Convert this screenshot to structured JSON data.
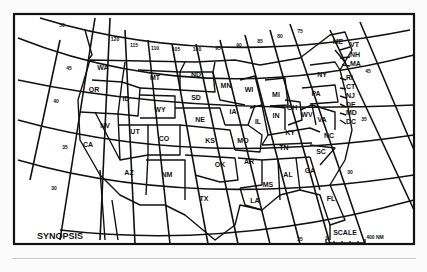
{
  "map": {
    "title": "SYNOPSIS",
    "frame_color": "#111111",
    "background": "#ffffff",
    "states": [
      {
        "abbr": "WA",
        "x": 103,
        "y": 70
      },
      {
        "abbr": "OR",
        "x": 94,
        "y": 92
      },
      {
        "abbr": "CA",
        "x": 88,
        "y": 147
      },
      {
        "abbr": "NV",
        "x": 105,
        "y": 128
      },
      {
        "abbr": "ID",
        "x": 126,
        "y": 101
      },
      {
        "abbr": "MT",
        "x": 155,
        "y": 80
      },
      {
        "abbr": "WY",
        "x": 160,
        "y": 112
      },
      {
        "abbr": "UT",
        "x": 135,
        "y": 134
      },
      {
        "abbr": "CO",
        "x": 164,
        "y": 141
      },
      {
        "abbr": "AZ",
        "x": 129,
        "y": 175
      },
      {
        "abbr": "NM",
        "x": 167,
        "y": 177
      },
      {
        "abbr": "ND",
        "x": 196,
        "y": 77
      },
      {
        "abbr": "SD",
        "x": 196,
        "y": 100
      },
      {
        "abbr": "NE",
        "x": 200,
        "y": 122
      },
      {
        "abbr": "KS",
        "x": 210,
        "y": 143
      },
      {
        "abbr": "OK",
        "x": 220,
        "y": 167
      },
      {
        "abbr": "TX",
        "x": 204,
        "y": 201
      },
      {
        "abbr": "MN",
        "x": 226,
        "y": 88
      },
      {
        "abbr": "IA",
        "x": 233,
        "y": 114
      },
      {
        "abbr": "MO",
        "x": 243,
        "y": 143
      },
      {
        "abbr": "AR",
        "x": 249,
        "y": 164
      },
      {
        "abbr": "LA",
        "x": 255,
        "y": 203
      },
      {
        "abbr": "WI",
        "x": 249,
        "y": 92
      },
      {
        "abbr": "IL",
        "x": 258,
        "y": 124
      },
      {
        "abbr": "MI",
        "x": 276,
        "y": 97
      },
      {
        "abbr": "IN",
        "x": 276,
        "y": 118
      },
      {
        "abbr": "OH",
        "x": 292,
        "y": 110
      },
      {
        "abbr": "KY",
        "x": 290,
        "y": 135
      },
      {
        "abbr": "TN",
        "x": 284,
        "y": 150
      },
      {
        "abbr": "MS",
        "x": 268,
        "y": 187
      },
      {
        "abbr": "AL",
        "x": 288,
        "y": 177
      },
      {
        "abbr": "GA",
        "x": 310,
        "y": 173
      },
      {
        "abbr": "FL",
        "x": 331,
        "y": 201
      },
      {
        "abbr": "SC",
        "x": 321,
        "y": 154
      },
      {
        "abbr": "NC",
        "x": 329,
        "y": 138
      },
      {
        "abbr": "VA",
        "x": 322,
        "y": 122
      },
      {
        "abbr": "WV",
        "x": 307,
        "y": 117
      },
      {
        "abbr": "PA",
        "x": 316,
        "y": 96
      },
      {
        "abbr": "NY",
        "x": 322,
        "y": 77
      },
      {
        "abbr": "ME",
        "x": 338,
        "y": 44
      }
    ],
    "ne_states": [
      {
        "abbr": "VT",
        "x": 350,
        "y": 47
      },
      {
        "abbr": "NH",
        "x": 350,
        "y": 57
      },
      {
        "abbr": "MA",
        "x": 350,
        "y": 66
      },
      {
        "abbr": "RI",
        "x": 346,
        "y": 80
      },
      {
        "abbr": "CT",
        "x": 346,
        "y": 89
      },
      {
        "abbr": "NJ",
        "x": 346,
        "y": 98
      },
      {
        "abbr": "DE",
        "x": 346,
        "y": 107
      },
      {
        "abbr": "MD",
        "x": 346,
        "y": 115
      },
      {
        "abbr": "DC",
        "x": 346,
        "y": 124
      }
    ],
    "longitude_labels": [
      {
        "t": "50",
        "x": 62,
        "y": 27
      },
      {
        "t": "120",
        "x": 115,
        "y": 41
      },
      {
        "t": "115",
        "x": 134,
        "y": 47
      },
      {
        "t": "110",
        "x": 155,
        "y": 50
      },
      {
        "t": "105",
        "x": 176,
        "y": 51
      },
      {
        "t": "100",
        "x": 197,
        "y": 51
      },
      {
        "t": "95",
        "x": 218,
        "y": 50
      },
      {
        "t": "90",
        "x": 239,
        "y": 47
      },
      {
        "t": "85",
        "x": 260,
        "y": 43
      },
      {
        "t": "80",
        "x": 280,
        "y": 38
      },
      {
        "t": "75",
        "x": 300,
        "y": 33
      }
    ],
    "latitude_labels": [
      {
        "t": "45",
        "x": 69,
        "y": 70
      },
      {
        "t": "40",
        "x": 56,
        "y": 103
      },
      {
        "t": "35",
        "x": 65,
        "y": 149
      },
      {
        "t": "30",
        "x": 54,
        "y": 190
      },
      {
        "t": "30",
        "x": 350,
        "y": 174
      },
      {
        "t": "25",
        "x": 300,
        "y": 241
      },
      {
        "t": "45",
        "x": 368,
        "y": 73
      },
      {
        "t": "35",
        "x": 364,
        "y": 121
      }
    ],
    "scale": {
      "label": "SCALE",
      "start": "0",
      "end": "400 NM"
    }
  }
}
